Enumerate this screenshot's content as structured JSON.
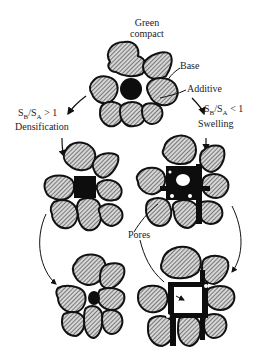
{
  "diagram": {
    "title_label": [
      "Green",
      "compact"
    ],
    "labels": {
      "base": "Base",
      "additive": "Additive",
      "left_ratio": "S_B/S_A > 1",
      "left_ratio_parts": {
        "s1": "S",
        "sub1": "B",
        "slash": "/S",
        "sub2": "A",
        "rest": " > 1"
      },
      "left_process": "Densification",
      "right_ratio": "S_B/S_A < 1",
      "right_ratio_parts": {
        "s1": "S",
        "sub1": "B",
        "slash": "/S",
        "sub2": "A",
        "rest": " < 1"
      },
      "right_process": "Swelling",
      "pores": "Pores"
    },
    "stages": [
      {
        "id": "green-compact",
        "position": "top-center",
        "description": "Base particles surrounding an additive particle"
      },
      {
        "id": "densification-intermediate",
        "position": "middle-left",
        "description": "Additive dissolves into base; compact shrinks"
      },
      {
        "id": "swelling-intermediate",
        "position": "middle-right",
        "description": "Additive penetrates grain boundaries leaving pore"
      },
      {
        "id": "densification-final",
        "position": "bottom-left",
        "description": "Dense final compact"
      },
      {
        "id": "swelling-final",
        "position": "bottom-right",
        "description": "Swollen final compact with large pore"
      }
    ],
    "colors": {
      "outline": "#111111",
      "hatch": "#333333",
      "particle_fill": "#cfcfcf",
      "liquid": "#0d0d0d",
      "background": "#ffffff",
      "text": "#222222"
    }
  }
}
